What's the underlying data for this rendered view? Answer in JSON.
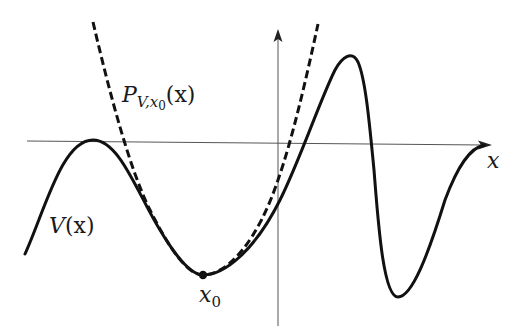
{
  "figure": {
    "colors": {
      "curve": "#111111",
      "axis": "#555555",
      "background": "#ffffff"
    },
    "labels": {
      "x_axis": "x",
      "potential": {
        "main": "V",
        "arg": "(x)"
      },
      "approximation": {
        "main": "P",
        "sub": "V,x",
        "subsub": "0",
        "arg": "(x)"
      },
      "min_point": {
        "main": "x",
        "sub": "0"
      }
    },
    "curves": [
      {
        "name": "V(x)",
        "style": "solid"
      },
      {
        "name": "P_{V,x0}(x)",
        "style": "dashed"
      }
    ],
    "marked_point": {
      "name": "x0",
      "marker": "filled-dot"
    }
  }
}
